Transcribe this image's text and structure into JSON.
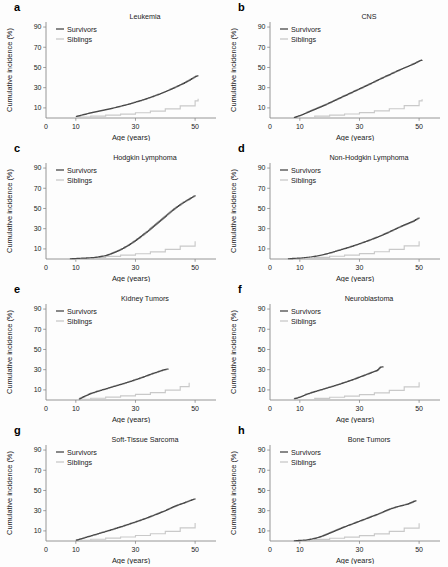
{
  "figure": {
    "width": 448,
    "height": 567,
    "background": "#fdfdfd",
    "axis_color": "#8a8a8a",
    "survivors_color": "#4a4a4a",
    "siblings_color": "#c9c9c9"
  },
  "common": {
    "xlabel": "Age (years)",
    "ylabel": "Cumulative incidence (%)",
    "xticks": [
      0,
      10,
      30,
      50
    ],
    "yticks": [
      10,
      30,
      50,
      70,
      90
    ],
    "xlim": [
      0,
      57
    ],
    "ylim": [
      0,
      95
    ],
    "legend": {
      "survivors_label": "Survivors",
      "siblings_label": "Siblings"
    }
  },
  "chart_data": [
    {
      "panel": "a",
      "type": "line",
      "title": "Leukemia",
      "xlabel": "Age (years)",
      "ylabel": "Cumulative incidence (%)",
      "xlim": [
        0,
        57
      ],
      "ylim": [
        0,
        95
      ],
      "xticks": [
        0,
        10,
        30,
        50
      ],
      "yticks": [
        10,
        30,
        50,
        70,
        90
      ],
      "grid": false,
      "legend_position": "top-left",
      "series": [
        {
          "name": "Survivors",
          "color": "#4a4a4a",
          "x": [
            10,
            12,
            14,
            16,
            18,
            20,
            22,
            24,
            26,
            28,
            30,
            32,
            34,
            36,
            38,
            40,
            42,
            44,
            46,
            48,
            50,
            51
          ],
          "values": [
            1.5,
            3.0,
            4.5,
            5.8,
            7.0,
            8.3,
            9.6,
            11.0,
            12.5,
            14.0,
            15.8,
            17.6,
            19.5,
            21.6,
            23.8,
            26.2,
            28.8,
            31.5,
            34.3,
            37.5,
            41.0,
            42.0
          ]
        },
        {
          "name": "Siblings",
          "color": "#c9c9c9",
          "x": [
            10,
            15,
            20,
            25,
            30,
            35,
            40,
            45,
            50,
            51
          ],
          "values": [
            0.8,
            1.8,
            2.8,
            3.9,
            5.2,
            6.8,
            9.0,
            12.0,
            17.0,
            19.0
          ]
        }
      ]
    },
    {
      "panel": "b",
      "type": "line",
      "title": "CNS",
      "xlabel": "Age (years)",
      "ylabel": "Cumulative incidence (%)",
      "xlim": [
        0,
        57
      ],
      "ylim": [
        0,
        95
      ],
      "xticks": [
        0,
        10,
        30,
        50
      ],
      "yticks": [
        10,
        30,
        50,
        70,
        90
      ],
      "grid": false,
      "legend_position": "top-left",
      "series": [
        {
          "name": "Survivors",
          "color": "#4a4a4a",
          "x": [
            8,
            10,
            12,
            14,
            16,
            18,
            20,
            22,
            24,
            26,
            28,
            30,
            32,
            34,
            36,
            38,
            40,
            42,
            44,
            46,
            48,
            50,
            51
          ],
          "values": [
            0.5,
            2.5,
            5.0,
            7.5,
            10.0,
            12.5,
            15.2,
            18.0,
            20.8,
            23.5,
            26.3,
            29.0,
            31.8,
            34.6,
            37.5,
            40.3,
            43.0,
            45.8,
            48.5,
            51.0,
            53.5,
            56.5,
            57.5
          ]
        },
        {
          "name": "Siblings",
          "color": "#c9c9c9",
          "x": [
            8,
            15,
            20,
            25,
            30,
            35,
            40,
            45,
            50,
            51
          ],
          "values": [
            0.5,
            1.8,
            2.8,
            4.0,
            5.3,
            7.0,
            9.2,
            12.3,
            17.0,
            18.5
          ]
        }
      ]
    },
    {
      "panel": "c",
      "type": "line",
      "title": "Hodgkin Lymphoma",
      "xlabel": "Age (years)",
      "ylabel": "Cumulative incidence (%)",
      "xlim": [
        0,
        57
      ],
      "ylim": [
        0,
        95
      ],
      "xticks": [
        0,
        10,
        30,
        50
      ],
      "yticks": [
        10,
        30,
        50,
        70,
        90
      ],
      "grid": false,
      "legend_position": "top-left",
      "series": [
        {
          "name": "Survivors",
          "color": "#4a4a4a",
          "x": [
            8,
            12,
            16,
            18,
            20,
            22,
            24,
            26,
            28,
            30,
            32,
            34,
            36,
            38,
            40,
            42,
            44,
            46,
            48,
            50
          ],
          "values": [
            0.3,
            0.8,
            1.5,
            2.3,
            3.5,
            5.5,
            8.0,
            11.0,
            14.5,
            18.5,
            23.0,
            27.5,
            32.5,
            37.5,
            42.5,
            47.5,
            52.0,
            56.0,
            59.5,
            63.0
          ]
        },
        {
          "name": "Siblings",
          "color": "#c9c9c9",
          "x": [
            8,
            15,
            20,
            25,
            30,
            35,
            40,
            45,
            50
          ],
          "values": [
            0.3,
            1.5,
            2.6,
            3.8,
            5.2,
            7.0,
            9.5,
            12.8,
            17.5
          ]
        }
      ]
    },
    {
      "panel": "d",
      "type": "line",
      "title": "Non-Hodgkin Lymphoma",
      "xlabel": "Age (years)",
      "ylabel": "Cumulative incidence (%)",
      "xlim": [
        0,
        57
      ],
      "ylim": [
        0,
        95
      ],
      "xticks": [
        0,
        10,
        30,
        50
      ],
      "yticks": [
        10,
        30,
        50,
        70,
        90
      ],
      "grid": false,
      "legend_position": "top-left",
      "series": [
        {
          "name": "Survivors",
          "color": "#4a4a4a",
          "x": [
            6,
            10,
            14,
            16,
            18,
            20,
            22,
            24,
            26,
            28,
            30,
            32,
            34,
            36,
            38,
            40,
            42,
            44,
            46,
            48,
            50
          ],
          "values": [
            0.3,
            1.0,
            2.2,
            3.2,
            4.5,
            6.0,
            7.8,
            9.5,
            11.3,
            13.2,
            15.2,
            17.3,
            19.5,
            21.8,
            24.3,
            27.0,
            29.8,
            32.5,
            35.0,
            37.5,
            41.0
          ]
        },
        {
          "name": "Siblings",
          "color": "#c9c9c9",
          "x": [
            6,
            15,
            20,
            25,
            30,
            35,
            40,
            45,
            50
          ],
          "values": [
            0.3,
            1.6,
            2.7,
            3.9,
            5.3,
            7.2,
            9.6,
            13.0,
            17.5
          ]
        }
      ]
    },
    {
      "panel": "e",
      "type": "line",
      "title": "Kidney Tumors",
      "xlabel": "Age (years)",
      "ylabel": "Cumulative incidence (%)",
      "xlim": [
        0,
        57
      ],
      "ylim": [
        0,
        95
      ],
      "xticks": [
        0,
        10,
        30,
        50
      ],
      "yticks": [
        10,
        30,
        50,
        70,
        90
      ],
      "grid": false,
      "legend_position": "top-left",
      "series": [
        {
          "name": "Survivors",
          "color": "#4a4a4a",
          "x": [
            11,
            13,
            15,
            17,
            19,
            21,
            23,
            25,
            27,
            29,
            31,
            33,
            35,
            37,
            39,
            41
          ],
          "values": [
            1.0,
            4.0,
            6.5,
            8.5,
            10.2,
            12.0,
            13.8,
            15.5,
            17.3,
            19.2,
            21.2,
            23.3,
            25.5,
            27.5,
            29.5,
            31.0
          ]
        },
        {
          "name": "Siblings",
          "color": "#c9c9c9",
          "x": [
            11,
            15,
            20,
            25,
            30,
            35,
            40,
            45,
            48
          ],
          "values": [
            0.6,
            1.7,
            2.9,
            4.1,
            5.5,
            7.3,
            9.8,
            13.2,
            17.0
          ]
        }
      ]
    },
    {
      "panel": "f",
      "type": "line",
      "title": "Neuroblastoma",
      "xlabel": "Age (years)",
      "ylabel": "Cumulative incidence (%)",
      "xlim": [
        0,
        57
      ],
      "ylim": [
        0,
        95
      ],
      "xticks": [
        0,
        10,
        30,
        50
      ],
      "yticks": [
        10,
        30,
        50,
        70,
        90
      ],
      "grid": false,
      "legend_position": "top-left",
      "series": [
        {
          "name": "Survivors",
          "color": "#4a4a4a",
          "x": [
            8,
            10,
            12,
            14,
            16,
            18,
            20,
            22,
            24,
            26,
            28,
            30,
            32,
            34,
            36,
            37,
            38
          ],
          "values": [
            1.2,
            3.0,
            5.5,
            7.5,
            9.3,
            11.0,
            12.8,
            14.6,
            16.5,
            18.5,
            20.5,
            22.8,
            25.0,
            27.3,
            29.5,
            32.5,
            33.0
          ]
        },
        {
          "name": "Siblings",
          "color": "#c9c9c9",
          "x": [
            8,
            15,
            20,
            25,
            30,
            35,
            40,
            45,
            50
          ],
          "values": [
            0.4,
            1.6,
            2.7,
            3.9,
            5.3,
            7.1,
            9.6,
            13.0,
            17.5
          ]
        }
      ]
    },
    {
      "panel": "g",
      "type": "line",
      "title": "Soft-Tissue Sarcoma",
      "xlabel": "Age (years)",
      "ylabel": "Cumulative incidence (%)",
      "xlim": [
        0,
        57
      ],
      "ylim": [
        0,
        95
      ],
      "xticks": [
        0,
        10,
        30,
        50
      ],
      "yticks": [
        10,
        30,
        50,
        70,
        90
      ],
      "grid": false,
      "legend_position": "top-left",
      "series": [
        {
          "name": "Survivors",
          "color": "#4a4a4a",
          "x": [
            10,
            12,
            14,
            16,
            18,
            20,
            22,
            24,
            26,
            28,
            30,
            32,
            34,
            36,
            38,
            40,
            42,
            44,
            46,
            48,
            50
          ],
          "values": [
            0.8,
            2.5,
            4.3,
            6.0,
            7.8,
            9.5,
            11.3,
            13.2,
            15.0,
            17.0,
            19.0,
            21.0,
            23.2,
            25.5,
            27.8,
            30.2,
            33.0,
            35.5,
            37.5,
            39.8,
            42.0
          ]
        },
        {
          "name": "Siblings",
          "color": "#c9c9c9",
          "x": [
            10,
            15,
            20,
            25,
            30,
            35,
            40,
            45,
            50
          ],
          "values": [
            0.6,
            1.7,
            2.8,
            4.0,
            5.4,
            7.2,
            9.6,
            13.0,
            17.8
          ]
        }
      ]
    },
    {
      "panel": "h",
      "type": "line",
      "title": "Bone Tumors",
      "xlabel": "Age (years)",
      "ylabel": "Cumulative incidence (%)",
      "xlim": [
        0,
        57
      ],
      "ylim": [
        0,
        95
      ],
      "xticks": [
        0,
        10,
        30,
        50
      ],
      "yticks": [
        10,
        30,
        50,
        70,
        90
      ],
      "grid": false,
      "legend_position": "top-left",
      "series": [
        {
          "name": "Survivors",
          "color": "#4a4a4a",
          "x": [
            8,
            12,
            14,
            16,
            18,
            20,
            22,
            24,
            26,
            28,
            30,
            32,
            34,
            36,
            38,
            40,
            42,
            44,
            46,
            48,
            49
          ],
          "values": [
            0.3,
            1.0,
            2.0,
            3.5,
            5.5,
            8.0,
            10.5,
            13.0,
            15.3,
            17.5,
            19.8,
            22.0,
            24.3,
            26.5,
            29.0,
            31.5,
            33.5,
            35.0,
            36.5,
            39.0,
            40.0
          ]
        },
        {
          "name": "Siblings",
          "color": "#c9c9c9",
          "x": [
            8,
            15,
            20,
            25,
            30,
            35,
            40,
            45,
            50
          ],
          "values": [
            0.3,
            1.6,
            2.7,
            3.9,
            5.3,
            7.1,
            9.5,
            12.8,
            17.5
          ]
        }
      ]
    }
  ]
}
